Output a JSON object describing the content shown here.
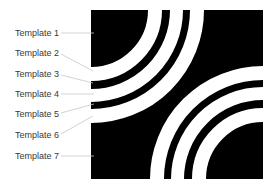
{
  "diagram": {
    "background_color": "#000000",
    "ring_color": "#ffffff",
    "leader_color": "#c8c8c8",
    "label_color": "#3a3a3a",
    "rings": [
      {
        "inner_radius": 57,
        "outer_radius": 71
      },
      {
        "inner_radius": 79,
        "outer_radius": 92
      },
      {
        "inner_radius": 99,
        "outer_radius": 113
      }
    ],
    "ring_centers": [
      "top-left",
      "bottom-right"
    ]
  },
  "labels": [
    {
      "text": "Template 1",
      "y": 28
    },
    {
      "text": "Template 2",
      "y": 48
    },
    {
      "text": "Template 3",
      "y": 69
    },
    {
      "text": "Template 4",
      "y": 89
    },
    {
      "text": "Template 5",
      "y": 109
    },
    {
      "text": "Template 6",
      "y": 130
    },
    {
      "text": "Template 7",
      "y": 151
    }
  ]
}
